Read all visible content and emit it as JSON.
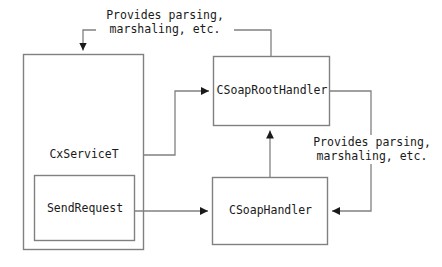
{
  "diagram": {
    "type": "block-diagram",
    "nodes": [
      {
        "id": "cxservicet",
        "label": "CxServiceT",
        "x": 23,
        "y": 54,
        "w": 121,
        "h": 196
      },
      {
        "id": "sendrequest",
        "label": "SendRequest",
        "x": 34,
        "y": 175,
        "w": 101,
        "h": 66
      },
      {
        "id": "csoaproothandler",
        "label": "CSoapRootHandler",
        "x": 213,
        "y": 56,
        "w": 117,
        "h": 70
      },
      {
        "id": "csoaphandler",
        "label": "CSoapHandler",
        "x": 212,
        "y": 177,
        "w": 116,
        "h": 68
      }
    ],
    "edge_labels": [
      {
        "id": "top-label",
        "line1": "Provides parsing,",
        "line2": "marshaling, etc."
      },
      {
        "id": "right-label",
        "line1": "Provides parsing,",
        "line2": "marshaling, etc."
      }
    ],
    "edges": [
      {
        "from": "csoaproothandler",
        "to": "cxservicet",
        "label": "top-label"
      },
      {
        "from": "cxservicet",
        "to": "csoaproothandler",
        "label": ""
      },
      {
        "from": "sendrequest",
        "to": "csoaphandler",
        "label": ""
      },
      {
        "from": "csoaphandler",
        "to": "csoaproothandler",
        "label": ""
      },
      {
        "from": "csoaproothandler",
        "to": "csoaphandler",
        "label": "right-label"
      }
    ],
    "colors": {
      "stroke": "#808080",
      "arrow": "#1a1a1a",
      "text": "#1a1a1a",
      "background": "#ffffff"
    }
  }
}
